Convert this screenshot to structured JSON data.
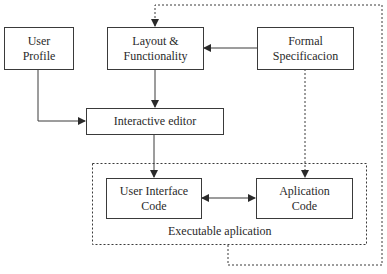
{
  "diagram": {
    "nodes": {
      "user_profile": {
        "line1": "User",
        "line2": "Profile"
      },
      "layout": {
        "line1": "Layout &",
        "line2": "Functionality"
      },
      "formal_spec": {
        "line1": "Formal",
        "line2": "Specificacion"
      },
      "interactive_editor": {
        "line1": "Interactive editor"
      },
      "ui_code": {
        "line1": "User Interface",
        "line2": "Code"
      },
      "app_code": {
        "line1": "Aplication",
        "line2": "Code"
      }
    },
    "groups": {
      "executable": {
        "label": "Executable aplication"
      }
    },
    "edges": [
      {
        "from": "user_profile",
        "to": "interactive_editor",
        "style": "solid"
      },
      {
        "from": "layout",
        "to": "interactive_editor",
        "style": "solid"
      },
      {
        "from": "formal_spec",
        "to": "layout",
        "style": "solid"
      },
      {
        "from": "interactive_editor",
        "to": "ui_code",
        "style": "solid"
      },
      {
        "from": "ui_code",
        "to": "app_code",
        "style": "solid",
        "bidirectional": true
      },
      {
        "from": "formal_spec",
        "to": "app_code",
        "style": "dashed"
      },
      {
        "from": "executable",
        "to": "layout",
        "style": "dashed"
      }
    ],
    "colors": {
      "stroke": "#3a3a3a",
      "background": "#ffffff"
    }
  }
}
